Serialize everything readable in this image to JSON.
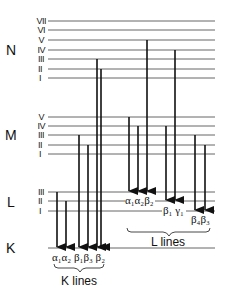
{
  "shells": [
    {
      "name": "N",
      "label_y": 52,
      "sublevels": [
        {
          "numeral": "VII",
          "y": 21
        },
        {
          "numeral": "VI",
          "y": 30
        },
        {
          "numeral": "V",
          "y": 40
        },
        {
          "numeral": "IV",
          "y": 50
        },
        {
          "numeral": "III",
          "y": 59
        },
        {
          "numeral": "II",
          "y": 69
        },
        {
          "numeral": "I",
          "y": 78
        }
      ]
    },
    {
      "name": "M",
      "label_y": 137,
      "sublevels": [
        {
          "numeral": "V",
          "y": 117
        },
        {
          "numeral": "IV",
          "y": 126
        },
        {
          "numeral": "III",
          "y": 135
        },
        {
          "numeral": "II",
          "y": 145
        },
        {
          "numeral": "I",
          "y": 154
        }
      ]
    },
    {
      "name": "L",
      "label_y": 206,
      "sublevels": [
        {
          "numeral": "III",
          "y": 192
        },
        {
          "numeral": "II",
          "y": 201
        },
        {
          "numeral": "I",
          "y": 211
        }
      ]
    },
    {
      "name": "K",
      "label_y": 253,
      "sublevels": [
        {
          "numeral": "",
          "y": 248
        }
      ]
    }
  ],
  "k_lines": {
    "label": "K lines",
    "transitions": [
      {
        "name": "α1",
        "from": "L-III",
        "to": "K"
      },
      {
        "name": "α2",
        "from": "L-II",
        "to": "K"
      },
      {
        "name": "β1",
        "from": "M-III",
        "to": "K"
      },
      {
        "name": "β3",
        "from": "M-II",
        "to": "K"
      },
      {
        "name": "β2",
        "from": "N-III/N-II",
        "to": "K"
      }
    ],
    "greek_labels": "α₁α₂ β₁β₃ β₂"
  },
  "l_lines": {
    "label": "L lines",
    "transitions": [
      {
        "name": "α1",
        "from": "M-V",
        "to": "L-III"
      },
      {
        "name": "α2",
        "from": "M-IV",
        "to": "L-III"
      },
      {
        "name": "β2",
        "from": "N-V",
        "to": "L-III"
      },
      {
        "name": "β1",
        "from": "M-IV",
        "to": "L-II"
      },
      {
        "name": "γ1",
        "from": "N-IV",
        "to": "L-II"
      },
      {
        "name": "β4",
        "from": "M-III",
        "to": "L-I"
      },
      {
        "name": "β3",
        "from": "M-II",
        "to": "L-I"
      }
    ],
    "greek_labels_a": "α₁α₂β₂",
    "greek_labels_b": "β₁ γ₁",
    "greek_labels_c": "β₄β₃"
  },
  "labels": {
    "N": "N",
    "M": "M",
    "L": "L",
    "K": "K",
    "VII": "VII",
    "VI": "VI",
    "V": "V",
    "IV": "IV",
    "III": "III",
    "II": "II",
    "I": "I",
    "k_lines": "K lines",
    "l_lines": "L lines",
    "k_greek": "α₁α₂ β₁β₃ β₂",
    "l_greek_a": "α₁α₂β₂",
    "l_greek_b": "β₁ γ₁",
    "l_greek_c": "β₄β₃"
  }
}
